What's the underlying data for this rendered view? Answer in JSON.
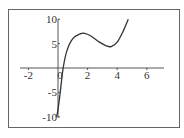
{
  "chart_data": {
    "type": "line",
    "title": "",
    "xlabel": "",
    "ylabel": "",
    "xlim": [
      -2.5,
      7
    ],
    "ylim": [
      -10.5,
      11
    ],
    "grid": false,
    "legend": null,
    "x_ticks": [
      -2,
      0,
      2,
      4,
      6
    ],
    "x_tick_labels": [
      "-2",
      "0",
      "2",
      "4",
      "6"
    ],
    "y_ticks": [
      -10,
      -5,
      5,
      10
    ],
    "y_tick_labels": [
      "-10",
      "-5",
      "5",
      "10"
    ],
    "series": [
      {
        "name": "f(x)",
        "x": [
          -0.1,
          0,
          0.15,
          0.35,
          0.6,
          1.0,
          1.5,
          1.8,
          2.2,
          2.8,
          3.3,
          3.6,
          4.0,
          4.4,
          4.75
        ],
        "y": [
          -10,
          -8.5,
          -5,
          0,
          3.5,
          6,
          7,
          7.1,
          6.6,
          5.3,
          4.5,
          4.4,
          5.3,
          7.5,
          10
        ]
      }
    ]
  },
  "colors": {
    "curve": "#333333",
    "axis": "#555555",
    "frame": "#666666",
    "background": "#ffffff"
  }
}
